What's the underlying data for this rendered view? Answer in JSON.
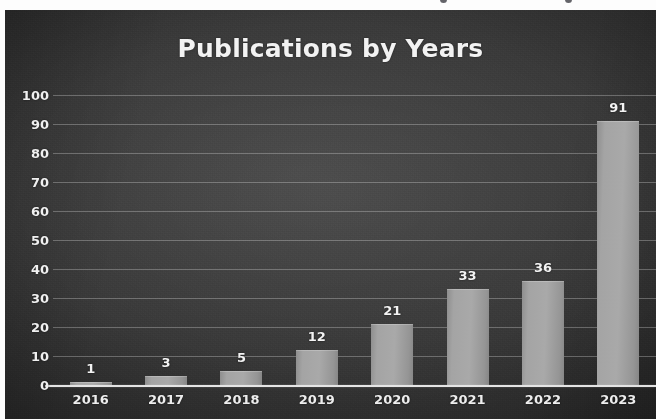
{
  "chart_data": {
    "type": "bar",
    "title": "Publications by Years",
    "xlabel": "",
    "ylabel": "",
    "categories": [
      "2016",
      "2017",
      "2018",
      "2019",
      "2020",
      "2021",
      "2022",
      "2023"
    ],
    "values": [
      1,
      3,
      5,
      12,
      21,
      33,
      36,
      91
    ],
    "data_labels": [
      "1",
      "3",
      "5",
      "12",
      "21",
      "33",
      "36",
      "91"
    ],
    "ylim": [
      0,
      100
    ],
    "ytick_labels": [
      "100",
      "90",
      "80",
      "70",
      "60",
      "50",
      "40",
      "30",
      "20",
      "10",
      "0"
    ],
    "ytick_values": [
      100,
      90,
      80,
      70,
      60,
      50,
      40,
      30,
      20,
      10,
      0
    ],
    "ytick_step": 10,
    "grid": true,
    "grid_axis": "y",
    "legend": false,
    "legend_position": "none",
    "series": [
      {
        "name": "Publications",
        "values": [
          1,
          3,
          5,
          12,
          21,
          33,
          36,
          91
        ]
      }
    ]
  },
  "style": {
    "background_color": "#3a3a3a",
    "bar_color": "#a0a0a0",
    "text_color": "#f2f2f2",
    "gridline_color": "#ececec",
    "axis_line_color": "#f4f4f4"
  }
}
